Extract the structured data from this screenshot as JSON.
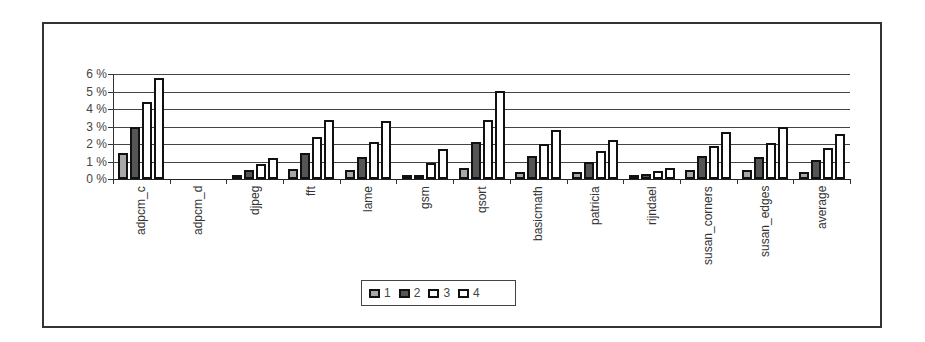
{
  "chart_data": {
    "type": "bar",
    "title": "",
    "xlabel": "",
    "ylabel": "",
    "ylim": [
      0,
      6
    ],
    "y_tick_labels": [
      "0 %",
      "1 %",
      "2 %",
      "3 %",
      "4 %",
      "5 %",
      "6 %"
    ],
    "grid": true,
    "legend_position": "bottom",
    "categories": [
      "adpcm_c",
      "adpcm_d",
      "djpeg",
      "fft",
      "lame",
      "gsm",
      "qsort",
      "basicmath",
      "patricia",
      "rijndael",
      "susan_corners",
      "susan_edges",
      "average"
    ],
    "series": [
      {
        "name": "1",
        "color": "#a8a8a8",
        "values": [
          1.5,
          0.0,
          0.2,
          0.6,
          0.5,
          0.05,
          0.65,
          0.4,
          0.4,
          0.1,
          0.5,
          0.5,
          0.4
        ]
      },
      {
        "name": "2",
        "color": "#555555",
        "values": [
          3.0,
          0.0,
          0.5,
          1.5,
          1.25,
          0.1,
          2.1,
          1.3,
          1.0,
          0.3,
          1.3,
          1.25,
          1.1
        ]
      },
      {
        "name": "3",
        "color": "#ffffff",
        "values": [
          4.4,
          0.0,
          0.85,
          2.4,
          2.1,
          0.9,
          3.4,
          2.0,
          1.6,
          0.45,
          1.9,
          2.05,
          1.8
        ]
      },
      {
        "name": "4",
        "color": "#ffffff",
        "values": [
          5.8,
          0.0,
          1.2,
          3.4,
          3.3,
          1.7,
          5.05,
          2.8,
          2.25,
          0.65,
          2.7,
          2.95,
          2.6
        ]
      }
    ]
  },
  "legend": {
    "items": [
      {
        "label": "1",
        "color": "#a8a8a8"
      },
      {
        "label": "2",
        "color": "#555555"
      },
      {
        "label": "3",
        "color": "#ffffff"
      },
      {
        "label": "4",
        "color": "#ffffff"
      }
    ]
  }
}
